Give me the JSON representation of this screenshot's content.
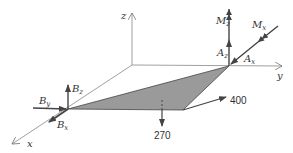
{
  "diagram": {
    "type": "free-body-diagram-3d",
    "axes": {
      "x": "x",
      "y": "y",
      "z": "z"
    },
    "support_A": {
      "forces": [
        {
          "symbol": "A",
          "subscript": "z"
        },
        {
          "symbol": "A",
          "subscript": "x"
        }
      ],
      "moments": [
        {
          "symbol": "M",
          "subscript": "z"
        },
        {
          "symbol": "M",
          "subscript": "x"
        }
      ]
    },
    "support_B": {
      "forces": [
        {
          "symbol": "B",
          "subscript": "y"
        },
        {
          "symbol": "B",
          "subscript": "z"
        },
        {
          "symbol": "B",
          "subscript": "x"
        }
      ]
    },
    "applied_loads": [
      {
        "label": "400",
        "direction": "horizontal-right"
      },
      {
        "label": "270",
        "direction": "down"
      }
    ],
    "colors": {
      "line": "#555555",
      "plate_fill": "#9a9a9a",
      "axis": "#888888"
    }
  }
}
